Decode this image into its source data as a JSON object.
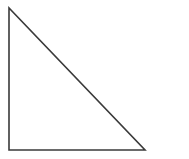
{
  "diagram": {
    "type": "right-triangle",
    "background": "#ffffff",
    "stroke_color": "#3a3a3a",
    "stroke_width": 1.6,
    "vertices": {
      "top": [
        9,
        8
      ],
      "bottom_left": [
        9,
        150
      ],
      "bottom_right": [
        145,
        150
      ]
    },
    "points": "9,8 9,150 145,150"
  }
}
